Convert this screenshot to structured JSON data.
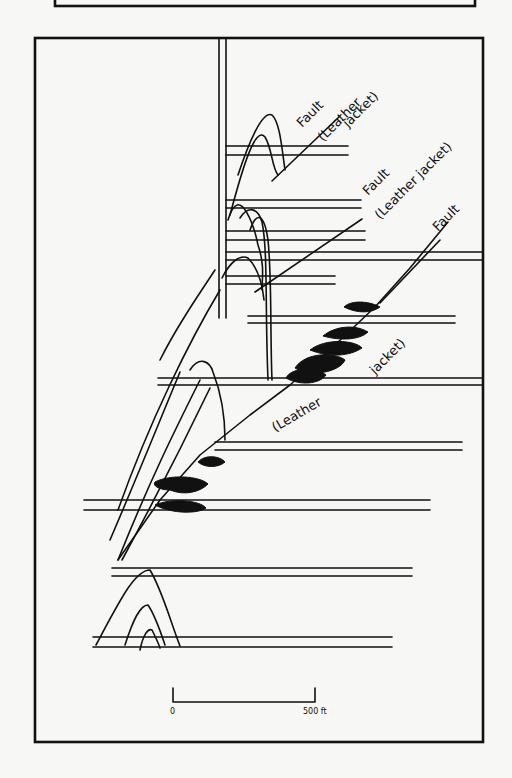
{
  "figure": {
    "top_strip": {
      "x": 55,
      "y": -6,
      "w": 420,
      "h": 12
    },
    "frame": {
      "x": 35,
      "y": 38,
      "w": 448,
      "h": 704
    },
    "shaft": {
      "x1": 219,
      "x2": 226,
      "y_top": 38,
      "y_bottom": 318
    },
    "levels": [
      {
        "x1": 226,
        "x2": 348,
        "y1": 146,
        "y2": 155
      },
      {
        "x1": 226,
        "x2": 361,
        "y1": 200,
        "y2": 208
      },
      {
        "x1": 226,
        "x2": 365,
        "y1": 231,
        "y2": 240
      },
      {
        "x1": 226,
        "x2": 482,
        "y1": 252,
        "y2": 260
      },
      {
        "x1": 226,
        "x2": 335,
        "y1": 276,
        "y2": 284
      },
      {
        "x1": 248,
        "x2": 455,
        "y1": 316,
        "y2": 323
      },
      {
        "x1": 158,
        "x2": 482,
        "y1": 378,
        "y2": 385
      },
      {
        "x1": 215,
        "x2": 462,
        "y1": 442,
        "y2": 450
      },
      {
        "x1": 84,
        "x2": 430,
        "y1": 500,
        "y2": 510
      },
      {
        "x1": 112,
        "x2": 412,
        "y1": 568,
        "y2": 576
      },
      {
        "x1": 93,
        "x2": 392,
        "y1": 637,
        "y2": 647
      }
    ],
    "faults": [
      {
        "points": "272,181 340,116"
      },
      {
        "points": "255,292 362,219"
      },
      {
        "points": "380,303 440,240"
      },
      {
        "points": "118,560 160,500 200,455 250,415 290,385 335,345 375,307 410,268 448,222"
      }
    ],
    "ore_bodies": [
      {
        "d": "M344,307 C352,299 372,302 380,307 C372,313 358,314 344,307 Z"
      },
      {
        "d": "M323,336 C335,326 355,324 368,332 C360,340 340,341 323,336 Z"
      },
      {
        "d": "M310,350 C325,338 355,340 362,348 C350,356 330,358 310,350 Z"
      },
      {
        "d": "M295,368 C305,352 335,352 345,360 C340,372 310,378 295,368 Z"
      },
      {
        "d": "M286,378 C292,366 318,368 326,375 C320,384 300,386 286,378 Z"
      },
      {
        "d": "M198,462 C205,454 220,456 225,462 C218,468 205,468 198,462 Z"
      },
      {
        "d": "M155,482 C170,474 200,476 208,484 C200,492 185,496 170,490 C160,490 152,486 155,482 Z"
      },
      {
        "d": "M155,505 C170,498 200,500 206,508 C198,514 172,514 155,505 Z"
      }
    ],
    "anticlines": [
      {
        "d": "M238,175 C248,145 262,110 272,115 C280,122 282,150 285,170"
      },
      {
        "d": "M230,215 C242,170 255,125 265,137 C272,148 272,168 278,175"
      },
      {
        "d": "M228,220 C240,180 255,230 258,245 C265,265 262,280 262,290"
      },
      {
        "d": "M222,278 C230,262 240,254 248,258 C256,266 262,280 264,300"
      },
      {
        "d": "M240,218 C248,205 258,208 262,222 C268,250 265,310 268,380"
      },
      {
        "d": "M250,230 C256,212 264,212 268,240 C272,280 270,330 272,380"
      },
      {
        "d": "M215,270 C195,300 175,330 160,360"
      },
      {
        "d": "M220,290 C190,340 150,420 118,510"
      },
      {
        "d": "M190,370 C200,355 210,362 213,372 C220,390 225,410 225,440"
      },
      {
        "d": "M180,372 C160,420 140,470 110,540"
      },
      {
        "d": "M200,380 C175,430 150,480 118,560"
      },
      {
        "d": "M210,388 C185,440 160,490 122,560"
      },
      {
        "d": "M96,645 C120,600 135,570 150,570 C162,590 170,620 180,646"
      },
      {
        "d": "M125,645 C133,620 140,605 148,605 C155,615 160,630 165,645"
      },
      {
        "d": "M140,650 C143,635 148,628 152,630 C155,636 158,642 160,648"
      }
    ],
    "labels": [
      {
        "text": "Fault",
        "x": 302,
        "y": 128,
        "rot": -45
      },
      {
        "text": "(Leather",
        "x": 323,
        "y": 142,
        "rot": -45
      },
      {
        "text": "jacket)",
        "x": 348,
        "y": 128,
        "rot": -45
      },
      {
        "text": "Fault",
        "x": 368,
        "y": 196,
        "rot": -45
      },
      {
        "text": "(Leather jacket)",
        "x": 380,
        "y": 220,
        "rot": -45
      },
      {
        "text": "Fault",
        "x": 438,
        "y": 232,
        "rot": -45
      },
      {
        "text": "jacket)",
        "x": 375,
        "y": 375,
        "rot": -45
      },
      {
        "text": "(Leather",
        "x": 275,
        "y": 432,
        "rot": -30
      }
    ],
    "scale_bar": {
      "x1": 173,
      "x2": 315,
      "y": 702,
      "tick_top": 688,
      "label_start": "0",
      "label_end": "500 ft"
    }
  }
}
